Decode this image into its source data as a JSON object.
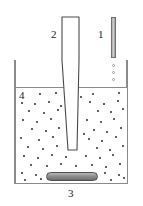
{
  "figure": {
    "width": 143,
    "height": 206,
    "background_color": "#ffffff"
  },
  "labels": [
    {
      "id": "1",
      "text": "1",
      "refers_to": "dropper-rod",
      "x": 98,
      "y": 29
    },
    {
      "id": "2",
      "text": "2",
      "refers_to": "ultrasonic-probe",
      "x": 51,
      "y": 29
    },
    {
      "id": "3",
      "text": "3",
      "refers_to": "magnetic-stir-bar",
      "x": 68,
      "y": 188
    },
    {
      "id": "4",
      "text": "4",
      "refers_to": "liquid-suspension",
      "x": 19,
      "y": 90
    }
  ],
  "vessel": {
    "name": "beaker",
    "outline_color": "#8a8a8a",
    "left": 14,
    "right": 127,
    "top": 60,
    "bottom": 184,
    "liquid_surface_y": 87
  },
  "probe": {
    "name": "ultrasonic-horn",
    "outline_color": "#4a4a4a",
    "fill_color": "#ffffff",
    "top_y": 17,
    "tip_y": 150,
    "shaft_left": 62,
    "shaft_right": 79,
    "tip_left": 68,
    "tip_right": 77,
    "taper_start_y": 60
  },
  "rod": {
    "name": "dropper-rod",
    "top": 17,
    "height": 41,
    "left": 111,
    "width": 5,
    "body_color": "#bdbdbd",
    "outline_color": "#6f6f6f"
  },
  "droplets": {
    "outline_color": "#9a9a9a",
    "count": 3,
    "positions": [
      {
        "x": 112,
        "y": 64
      },
      {
        "x": 112,
        "y": 71
      },
      {
        "x": 112,
        "y": 78
      }
    ]
  },
  "stir_bar": {
    "name": "magnetic-stir-bar",
    "left": 46,
    "top": 172,
    "width": 52,
    "height": 9,
    "fill_color": "#8e8e8e",
    "outline_color": "#4f4f4f"
  },
  "particles": {
    "color": "#2b2b2b",
    "size": 2,
    "positions": [
      [
        39,
        93
      ],
      [
        55,
        92
      ],
      [
        92,
        93
      ],
      [
        118,
        92
      ],
      [
        21,
        102
      ],
      [
        34,
        103
      ],
      [
        48,
        101
      ],
      [
        60,
        105
      ],
      [
        89,
        101
      ],
      [
        103,
        103
      ],
      [
        117,
        100
      ],
      [
        28,
        110
      ],
      [
        43,
        112
      ],
      [
        57,
        109
      ],
      [
        97,
        110
      ],
      [
        110,
        111
      ],
      [
        122,
        108
      ],
      [
        22,
        119
      ],
      [
        36,
        121
      ],
      [
        50,
        118
      ],
      [
        86,
        119
      ],
      [
        100,
        121
      ],
      [
        113,
        118
      ],
      [
        31,
        128
      ],
      [
        45,
        130
      ],
      [
        58,
        127
      ],
      [
        93,
        129
      ],
      [
        106,
        131
      ],
      [
        120,
        127
      ],
      [
        20,
        137
      ],
      [
        38,
        139
      ],
      [
        52,
        136
      ],
      [
        88,
        138
      ],
      [
        101,
        140
      ],
      [
        115,
        136
      ],
      [
        27,
        146
      ],
      [
        42,
        148
      ],
      [
        56,
        145
      ],
      [
        96,
        147
      ],
      [
        109,
        149
      ],
      [
        122,
        145
      ],
      [
        23,
        155
      ],
      [
        37,
        157
      ],
      [
        51,
        154
      ],
      [
        65,
        156
      ],
      [
        85,
        155
      ],
      [
        99,
        157
      ],
      [
        112,
        154
      ],
      [
        30,
        164
      ],
      [
        46,
        165
      ],
      [
        60,
        163
      ],
      [
        75,
        165
      ],
      [
        91,
        164
      ],
      [
        105,
        166
      ],
      [
        119,
        163
      ],
      [
        21,
        172
      ],
      [
        35,
        174
      ],
      [
        104,
        172
      ],
      [
        118,
        174
      ],
      [
        24,
        179
      ],
      [
        40,
        178
      ],
      [
        110,
        179
      ],
      [
        123,
        177
      ],
      [
        67,
        97
      ],
      [
        80,
        96
      ],
      [
        72,
        113
      ],
      [
        83,
        133
      ]
    ]
  }
}
